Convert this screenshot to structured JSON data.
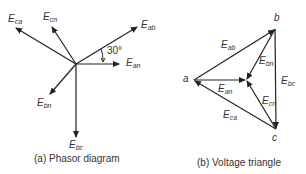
{
  "phasor": {
    "caption": "(a) Phasor diagram",
    "angle_label": "30°",
    "vectors": [
      {
        "name": "E",
        "sub": "ca"
      },
      {
        "name": "E",
        "sub": "cn"
      },
      {
        "name": "E",
        "sub": "ab"
      },
      {
        "name": "E",
        "sub": "an"
      },
      {
        "name": "E",
        "sub": "bn"
      },
      {
        "name": "E",
        "sub": "bc"
      }
    ]
  },
  "triangle": {
    "caption": "(b) Voltage triangle",
    "vertices": {
      "a": "a",
      "b": "b",
      "c": "c"
    },
    "edges": [
      {
        "name": "E",
        "sub": "ab"
      },
      {
        "name": "E",
        "sub": "bn"
      },
      {
        "name": "E",
        "sub": "an"
      },
      {
        "name": "E",
        "sub": "bc"
      },
      {
        "name": "E",
        "sub": "cn"
      },
      {
        "name": "E",
        "sub": "ca"
      }
    ]
  },
  "colors": {
    "line": "#222222",
    "text": "#333333"
  }
}
